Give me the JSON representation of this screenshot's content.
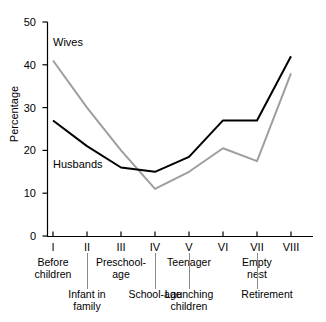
{
  "chart_data": {
    "type": "line",
    "title": "",
    "xlabel": "",
    "ylabel": "Percentage",
    "ylim": [
      0,
      50
    ],
    "yticks": [
      0,
      10,
      20,
      30,
      40,
      50
    ],
    "grid": false,
    "legend": "direct-labels-on-lines",
    "x": [
      "I",
      "II",
      "III",
      "IV",
      "V",
      "VI",
      "VII",
      "VIII"
    ],
    "categories": [
      "Before children",
      "Infant in family",
      "Preschool-age",
      "School-age",
      "Teenager",
      "Launching children",
      "Empty nest",
      "Retirement"
    ],
    "series": [
      {
        "name": "Wives",
        "color": "#9e9e9e",
        "values": [
          41,
          30,
          20,
          11,
          15,
          20.5,
          17.5,
          38
        ]
      },
      {
        "name": "Husbands",
        "color": "#000000",
        "values": [
          27,
          21,
          16,
          15,
          18.5,
          27,
          27,
          42
        ]
      }
    ]
  },
  "axes": {
    "y_title": "Percentage",
    "y_tick_labels": [
      "50",
      "40",
      "30",
      "20",
      "10",
      "0"
    ],
    "x_roman": [
      "I",
      "II",
      "III",
      "IV",
      "V",
      "VI",
      "VII",
      "VIII"
    ]
  },
  "stage_captions": {
    "upper": [
      {
        "stage": "I",
        "line1": "Before",
        "line2": "children"
      },
      {
        "stage": "III",
        "line1": "Preschool-",
        "line2": "age"
      },
      {
        "stage": "V",
        "line1": "Teenager",
        "line2": ""
      },
      {
        "stage": "VII",
        "line1": "Empty",
        "line2": "nest"
      }
    ],
    "lower": [
      {
        "stage": "II",
        "line1": "Infant in",
        "line2": "family"
      },
      {
        "stage": "IV",
        "line1": "School-age",
        "line2": ""
      },
      {
        "stage": "VI",
        "line1": "Launching",
        "line2": "children"
      },
      {
        "stage": "VIII",
        "line1": "Retirement",
        "line2": ""
      }
    ]
  },
  "series_labels": {
    "wives": "Wives",
    "husbands": "Husbands"
  }
}
